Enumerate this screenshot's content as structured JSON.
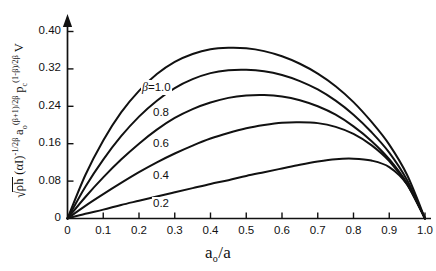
{
  "chart_data": {
    "type": "line",
    "title": "",
    "xlabel": "aₒ/a",
    "ylabel": "√ρh (αI)^(-1/2β) aₒ^((β+1)/2β) p_c^((1-β)/2β) V",
    "xlim": [
      0,
      1.0
    ],
    "ylim": [
      0,
      0.44
    ],
    "grid": false,
    "legend_position": "inline-curve-labels",
    "x_ticks": [
      "0",
      "0.1",
      "0.2",
      "0.3",
      "0.4",
      "0.5",
      "0.6",
      "0.7",
      "0.8",
      "0.9",
      "1.0"
    ],
    "x_tick_values": [
      0,
      0.1,
      0.2,
      0.3,
      0.4,
      0.5,
      0.6,
      0.7,
      0.8,
      0.9,
      1.0
    ],
    "y_ticks": [
      "0",
      "0.08",
      "0.16",
      "0.24",
      "0.32",
      "0.40"
    ],
    "y_tick_values": [
      0,
      0.08,
      0.16,
      0.24,
      0.32,
      0.4
    ],
    "series": [
      {
        "name": "β=1.0",
        "beta": 1.0,
        "peak_x": 0.52,
        "peak_y": 0.365,
        "x": [
          0.0,
          0.05,
          0.1,
          0.15,
          0.2,
          0.25,
          0.3,
          0.35,
          0.4,
          0.45,
          0.5,
          0.55,
          0.6,
          0.65,
          0.7,
          0.75,
          0.8,
          0.85,
          0.9,
          0.95,
          1.0
        ],
        "values": [
          0.0,
          0.093,
          0.167,
          0.227,
          0.273,
          0.309,
          0.335,
          0.352,
          0.362,
          0.365,
          0.364,
          0.358,
          0.347,
          0.331,
          0.31,
          0.283,
          0.249,
          0.207,
          0.158,
          0.093,
          0.0
        ]
      },
      {
        "name": "0.8",
        "beta": 0.8,
        "peak_x": 0.57,
        "peak_y": 0.318,
        "x": [
          0.0,
          0.05,
          0.1,
          0.15,
          0.2,
          0.25,
          0.3,
          0.35,
          0.4,
          0.45,
          0.5,
          0.55,
          0.6,
          0.65,
          0.7,
          0.75,
          0.8,
          0.85,
          0.9,
          0.95,
          1.0
        ],
        "values": [
          0.0,
          0.068,
          0.126,
          0.176,
          0.218,
          0.252,
          0.279,
          0.298,
          0.311,
          0.317,
          0.318,
          0.315,
          0.307,
          0.294,
          0.276,
          0.252,
          0.222,
          0.185,
          0.141,
          0.082,
          0.0
        ]
      },
      {
        "name": "0.6",
        "beta": 0.6,
        "peak_x": 0.62,
        "peak_y": 0.264,
        "x": [
          0.0,
          0.05,
          0.1,
          0.15,
          0.2,
          0.25,
          0.3,
          0.35,
          0.4,
          0.45,
          0.5,
          0.55,
          0.6,
          0.65,
          0.7,
          0.75,
          0.8,
          0.85,
          0.9,
          0.95,
          1.0
        ],
        "values": [
          0.0,
          0.046,
          0.088,
          0.126,
          0.16,
          0.19,
          0.215,
          0.234,
          0.248,
          0.258,
          0.263,
          0.264,
          0.261,
          0.253,
          0.24,
          0.222,
          0.197,
          0.166,
          0.127,
          0.075,
          0.0
        ]
      },
      {
        "name": "0.4",
        "beta": 0.4,
        "peak_x": 0.7,
        "peak_y": 0.206,
        "x": [
          0.0,
          0.05,
          0.1,
          0.15,
          0.2,
          0.25,
          0.3,
          0.35,
          0.4,
          0.45,
          0.5,
          0.55,
          0.6,
          0.65,
          0.7,
          0.75,
          0.8,
          0.85,
          0.9,
          0.95,
          1.0
        ],
        "values": [
          0.0,
          0.027,
          0.052,
          0.076,
          0.099,
          0.12,
          0.139,
          0.156,
          0.171,
          0.183,
          0.193,
          0.2,
          0.205,
          0.206,
          0.204,
          0.196,
          0.181,
          0.157,
          0.123,
          0.073,
          0.0
        ]
      },
      {
        "name": "0.2",
        "beta": 0.2,
        "peak_x": 0.83,
        "peak_y": 0.128,
        "x": [
          0.0,
          0.05,
          0.1,
          0.15,
          0.2,
          0.25,
          0.3,
          0.35,
          0.4,
          0.45,
          0.5,
          0.55,
          0.6,
          0.65,
          0.7,
          0.75,
          0.8,
          0.85,
          0.9,
          0.95,
          1.0
        ],
        "values": [
          0.0,
          0.01,
          0.019,
          0.029,
          0.038,
          0.047,
          0.056,
          0.065,
          0.074,
          0.082,
          0.091,
          0.099,
          0.107,
          0.115,
          0.122,
          0.127,
          0.128,
          0.124,
          0.11,
          0.073,
          0.0
        ]
      }
    ],
    "curve_labels": [
      {
        "text": "1.0",
        "prefix": "β=",
        "x": 141,
        "y": 88
      },
      {
        "text": "0.8",
        "prefix": "",
        "x": 152,
        "y": 114
      },
      {
        "text": "0.6",
        "prefix": "",
        "x": 152,
        "y": 145
      },
      {
        "text": "0.4",
        "prefix": "",
        "x": 152,
        "y": 177
      },
      {
        "text": "0.2",
        "prefix": "",
        "x": 152,
        "y": 205
      }
    ],
    "ylabel_parts": {
      "sqrt_content": "ρh",
      "term1": "(αI)",
      "term1_sup": "-1/2β",
      "term2": "a",
      "term2_sub": "o",
      "term2_sup": "(β+1)/2β",
      "term3": "p",
      "term3_sub": "c",
      "term3_sup": "(1-β)/2β",
      "term4": "V"
    },
    "axis_colors": {
      "axis": "#111111",
      "curve": "#111111",
      "background": "#ffffff"
    }
  }
}
